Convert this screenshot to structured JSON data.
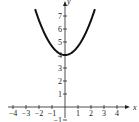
{
  "chart_data": {
    "type": "line",
    "title": "",
    "xlabel": "x",
    "ylabel": "y",
    "xlim": [
      -4,
      4
    ],
    "ylim": [
      -1,
      7
    ],
    "x_ticks": [
      "-4",
      "-3",
      "-2",
      "-1",
      "1",
      "2",
      "3",
      "4"
    ],
    "y_ticks": [
      "-1",
      "1",
      "2",
      "3",
      "4",
      "5",
      "6",
      "7"
    ],
    "grid": false,
    "legend": null,
    "series": [
      {
        "name": "parabola",
        "description": "Upward-opening parabola with vertex at (0, 4)",
        "x": [
          -2.3,
          -2,
          -1.5,
          -1,
          -0.5,
          0,
          0.5,
          1,
          1.5,
          2,
          2.3
        ],
        "y": [
          7.5,
          6.67,
          5.5,
          4.67,
          4.17,
          4,
          4.17,
          4.67,
          5.5,
          6.67,
          7.5
        ]
      }
    ]
  }
}
